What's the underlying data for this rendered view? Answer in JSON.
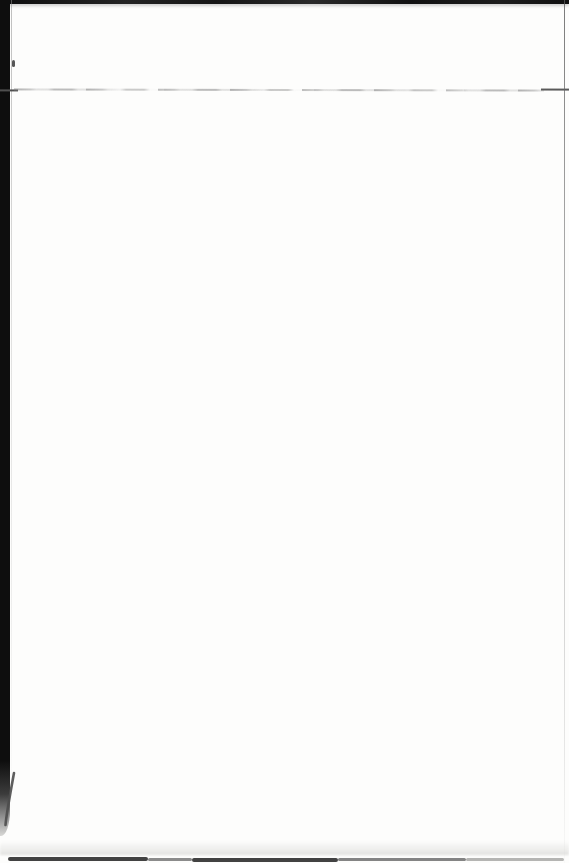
{
  "page": {
    "kind": "scanned-blank-book-page",
    "text_content": ""
  },
  "colors": {
    "paper": "#fdfdfc",
    "scan_edge_black": "#0e0e0e",
    "crease_cap_left": "#4f4f4f",
    "crease_cap_right": "#5a5a5a",
    "curl_line": "#4d4d4d",
    "speck": "#3a3a3a",
    "bottom_band_dark": "#424242",
    "bottom_band_mid": "#6e6e6e",
    "bottom_band_light": "#b5b5b3"
  },
  "artifacts": {
    "top_edge_shadow": "dark scan edge across full width at top",
    "left_gutter_bar": "solid black vertical scan gutter, full height, fading near bottom",
    "crease_line": "faint broken horizontal line near top of page",
    "right_edge_line": "thin gray page edge line near right side",
    "page_corner_curl": "curved page-edge line at bottom-left corner",
    "bottom_edge_shadow": "irregular dark band along bottom edge"
  }
}
